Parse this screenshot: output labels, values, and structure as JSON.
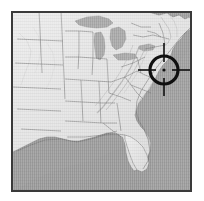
{
  "view": {
    "width": 204,
    "height": 201,
    "background_color": "#ffffff",
    "title": "Shaded relief map of the eastern United States with target crosshair"
  },
  "map": {
    "name": "eastern-united-states-relief-map",
    "style": "grayscale-shaded-relief",
    "frame": {
      "border_color": "#3a3a3a",
      "border_width_px": 2,
      "x": 11,
      "y": 11,
      "width": 181,
      "height": 181
    },
    "colors": {
      "ocean": "#9b9b9b",
      "great_lakes": "#a5a5a5",
      "land_base": "#e2e2e2",
      "land_highlight": "#f2f2f2",
      "land_shadow": "#bdbdbd",
      "state_boundary": "#6e6e6e",
      "coastline": "#707070",
      "marker": "#101010"
    },
    "features": [
      {
        "label": "Atlantic Ocean",
        "type": "water"
      },
      {
        "label": "Gulf of Mexico",
        "type": "water"
      },
      {
        "label": "Lake Superior",
        "type": "lake"
      },
      {
        "label": "Lake Michigan",
        "type": "lake"
      },
      {
        "label": "Lake Huron",
        "type": "lake"
      },
      {
        "label": "Lake Erie",
        "type": "lake"
      },
      {
        "label": "Lake Ontario",
        "type": "lake"
      },
      {
        "label": "Appalachian Mountains",
        "type": "relief"
      },
      {
        "label": "Florida Peninsula",
        "type": "land"
      },
      {
        "label": "Great Plains",
        "type": "land"
      }
    ]
  },
  "marker": {
    "name": "target-crosshair",
    "center_x": 164,
    "center_y": 70,
    "circle_radius_px": 16,
    "circle_stroke_px": 4,
    "arm_length_px": 25,
    "center_dot_radius_px": 2,
    "color": "#101010",
    "description": "Target reticle over the mid-Atlantic region"
  }
}
